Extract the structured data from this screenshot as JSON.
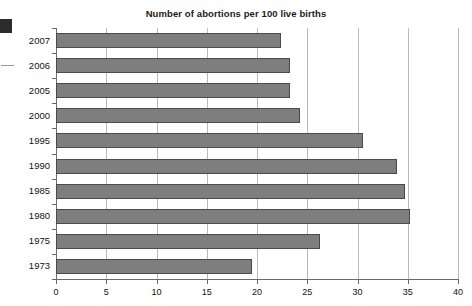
{
  "chart_data": {
    "type": "bar",
    "orientation": "horizontal",
    "title": "Number of abortions per 100 live births",
    "xlabel": "",
    "ylabel": "",
    "categories": [
      "2007",
      "2006",
      "2005",
      "2000",
      "1995",
      "1990",
      "1985",
      "1980",
      "1975",
      "1973"
    ],
    "values": [
      22.4,
      23.3,
      23.3,
      24.3,
      30.5,
      33.9,
      34.7,
      35.2,
      26.3,
      19.5
    ],
    "xlim": [
      0,
      40
    ],
    "xticks": [
      "0",
      "5",
      "10",
      "15",
      "20",
      "25",
      "30",
      "35",
      "40"
    ],
    "xtick_values": [
      0,
      5,
      10,
      15,
      20,
      25,
      30,
      35,
      40
    ],
    "grid": "vertical",
    "legend": "none",
    "bar_color": "#7e7e7e",
    "bar_edge_color": "#4a4a4a",
    "gridline_color": "#b9b9b9",
    "axis_color": "#6a6a6a",
    "text_color": "#111111"
  },
  "artifacts": {
    "scan_block_label": "scan-artifact-block",
    "scan_dash_label": "scan-artifact-dash"
  }
}
